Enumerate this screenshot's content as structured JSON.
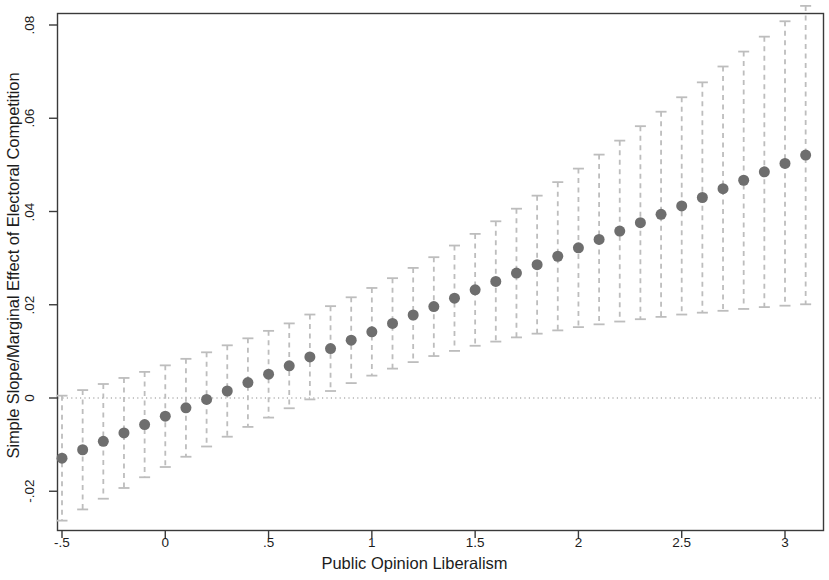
{
  "chart_data": {
    "type": "scatter",
    "title": "",
    "subtitle": "",
    "xlabel": "Public Opinion Liberalism",
    "ylabel": "Simple Slope/Marginal Effect of Electoral Competition",
    "xlim": [
      -0.585,
      3.175
    ],
    "ylim": [
      -0.0284,
      0.0829
    ],
    "grid": false,
    "legend": null,
    "zero_reference_line": {
      "value": 0,
      "style": "dotted",
      "color": "#b4b4b4"
    },
    "marker": {
      "shape": "circle",
      "color": "#6e6e6e",
      "size_px": 11
    },
    "errorbar": {
      "style": "dashed",
      "color": "#bdbdbd",
      "cap": true,
      "cap_width_px": 11
    },
    "x_ticks": [
      -0.5,
      0,
      0.5,
      1,
      1.5,
      2,
      2.5,
      3
    ],
    "x_tick_labels": [
      "-.5",
      "0",
      ".5",
      "1",
      "1.5",
      "2",
      "2.5",
      "3"
    ],
    "y_ticks": [
      -0.02,
      0,
      0.02,
      0.04,
      0.06,
      0.08
    ],
    "y_tick_labels": [
      "-.02",
      "0",
      ".02",
      ".04",
      ".06",
      ".08"
    ],
    "x": [
      -0.5,
      -0.4,
      -0.3,
      -0.2,
      -0.1,
      0,
      0.1,
      0.2,
      0.3,
      0.4,
      0.5,
      0.6,
      0.7,
      0.8,
      0.9,
      1.0,
      1.1,
      1.2,
      1.3,
      1.4,
      1.5,
      1.6,
      1.7,
      1.8,
      1.9,
      2.0,
      2.1,
      2.2,
      2.3,
      2.4,
      2.5,
      2.6,
      2.7,
      2.8,
      2.9,
      3.0,
      3.1
    ],
    "y": [
      -0.0129,
      -0.0111,
      -0.0093,
      -0.0075,
      -0.0057,
      -0.0039,
      -0.0021,
      -0.0003,
      0.0015,
      0.0033,
      0.0051,
      0.0069,
      0.0088,
      0.0106,
      0.0124,
      0.0142,
      0.016,
      0.0178,
      0.0196,
      0.0214,
      0.0232,
      0.025,
      0.0268,
      0.0286,
      0.0304,
      0.0322,
      0.034,
      0.0358,
      0.0376,
      0.0394,
      0.0412,
      0.043,
      0.0449,
      0.0467,
      0.0485,
      0.0503,
      0.0521
    ],
    "ci_lower": [
      -0.0263,
      -0.0239,
      -0.0216,
      -0.0193,
      -0.017,
      -0.0148,
      -0.0126,
      -0.0104,
      -0.0083,
      -0.0062,
      -0.0042,
      -0.0022,
      -0.0003,
      0.0015,
      0.0032,
      0.0048,
      0.0063,
      0.0077,
      0.009,
      0.0101,
      0.0112,
      0.0121,
      0.013,
      0.0138,
      0.0145,
      0.0152,
      0.0158,
      0.0164,
      0.0169,
      0.0174,
      0.0179,
      0.0183,
      0.0187,
      0.0191,
      0.0195,
      0.0198,
      0.0201
    ],
    "ci_upper": [
      0.0005,
      0.0017,
      0.003,
      0.0043,
      0.0056,
      0.007,
      0.0084,
      0.0098,
      0.0113,
      0.0128,
      0.0144,
      0.016,
      0.0179,
      0.0197,
      0.0216,
      0.0236,
      0.0257,
      0.0279,
      0.0302,
      0.0327,
      0.0352,
      0.0379,
      0.0406,
      0.0434,
      0.0463,
      0.0492,
      0.0522,
      0.0552,
      0.0583,
      0.0614,
      0.0645,
      0.0677,
      0.0711,
      0.0743,
      0.0775,
      0.0808,
      0.0841
    ],
    "series_name": "Marginal effect with 95% confidence interval",
    "n_points": 37
  },
  "axes": {
    "x_label": "Public Opinion Liberalism",
    "y_label": "Simple Slope/Marginal Effect of Electoral Competition"
  },
  "ticks": {
    "y": [
      "-.02",
      "0",
      ".02",
      ".04",
      ".06",
      ".08"
    ],
    "x": [
      "-.5",
      "0",
      ".5",
      "1",
      "1.5",
      "2",
      "2.5",
      "3"
    ]
  }
}
